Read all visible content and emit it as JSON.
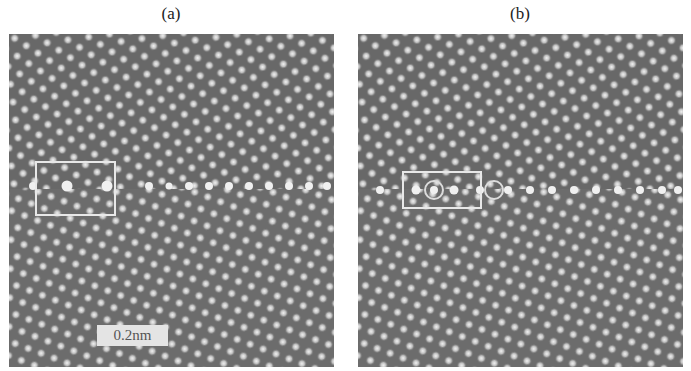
{
  "figure": {
    "panels": [
      {
        "id": "a",
        "label": "(a)",
        "roi_box": {
          "left": 26,
          "top": 127,
          "width": 81,
          "height": 55
        },
        "scale_bar_label": "0.2nm"
      },
      {
        "id": "b",
        "label": "(b)",
        "roi_box": {
          "left": 44,
          "top": 137,
          "width": 80,
          "height": 38
        }
      }
    ],
    "colors": {
      "background_gray": "#6a6a6a",
      "atom_bright": "#f2f2f2",
      "box_outline": "#e8e8e8"
    }
  }
}
